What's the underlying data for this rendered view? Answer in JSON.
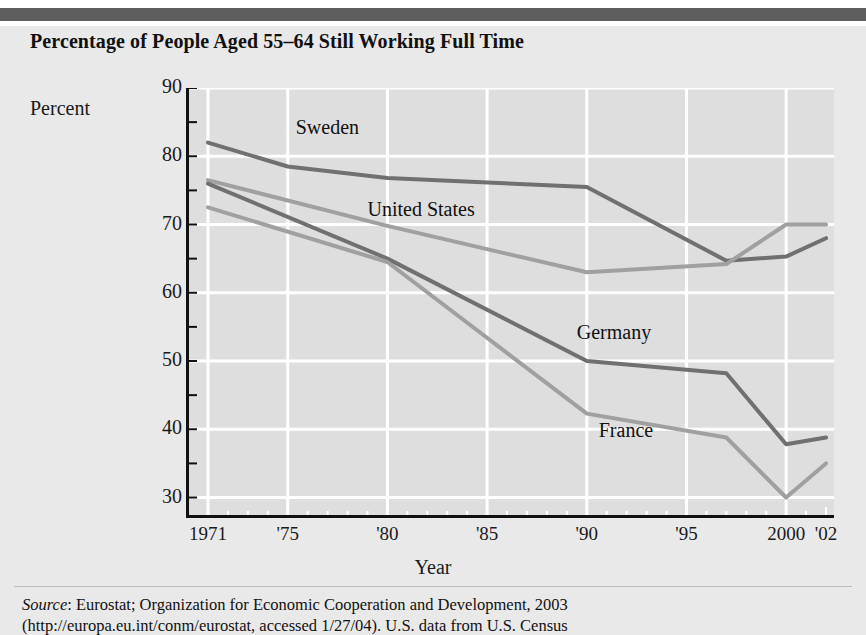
{
  "figure": {
    "title": "Percentage of People Aged 55–64 Still Working Full Time",
    "ylabel_text": "Percent",
    "xlabel_text": "Year",
    "source_prefix": "Source",
    "source_line1": ": Eurostat; Organization for Economic Cooperation and Development, 2003",
    "source_line2": "(http://europa.eu.int/conm/eurostat, accessed 1/27/04). U.S. data from U.S. Census"
  },
  "colors": {
    "page_background": "#ffffff",
    "panel_background": "#e9e9e9",
    "topbar": "#5e5e5e",
    "plot_background": "#dedede",
    "gridline": "#ffffff",
    "axis": "#111111",
    "series_dark": "#707070",
    "series_light": "#a0a0a0",
    "text": "#111111"
  },
  "chart_data": {
    "type": "line",
    "title": "Percentage of People Aged 55–64 Still Working Full Time",
    "xlabel": "Year",
    "ylabel": "Percent",
    "xlim": [
      1971,
      2002
    ],
    "ylim": [
      27,
      90
    ],
    "grid": true,
    "legend": "inline-labels",
    "yticks": [
      90,
      80,
      70,
      60,
      50,
      40,
      30
    ],
    "xticks": [
      {
        "value": 1971,
        "label": "1971"
      },
      {
        "value": 1975,
        "label": "'75"
      },
      {
        "value": 1980,
        "label": "'80"
      },
      {
        "value": 1985,
        "label": "'85"
      },
      {
        "value": 1990,
        "label": "'90"
      },
      {
        "value": 1995,
        "label": "'95"
      },
      {
        "value": 2000,
        "label": "2000"
      },
      {
        "value": 2002,
        "label": "'02"
      }
    ],
    "series": [
      {
        "name": "Sweden",
        "color": "#707070",
        "label_x": 1975.4,
        "label_y": 84.0,
        "x": [
          1971,
          1975,
          1980,
          1990,
          1997,
          2000,
          2002
        ],
        "values": [
          82.0,
          78.5,
          76.8,
          75.5,
          64.7,
          65.3,
          68.0
        ]
      },
      {
        "name": "United States",
        "color": "#a0a0a0",
        "label_x": 1979.0,
        "label_y": 72.0,
        "x": [
          1971,
          1980,
          1990,
          1997,
          2000,
          2002
        ],
        "values": [
          76.5,
          69.8,
          63.0,
          64.2,
          70.0,
          70.0
        ]
      },
      {
        "name": "Germany",
        "color": "#707070",
        "label_x": 1989.5,
        "label_y": 54.0,
        "x": [
          1971,
          1980,
          1990,
          1997,
          2000,
          2002
        ],
        "values": [
          76.0,
          65.0,
          50.0,
          48.2,
          37.8,
          38.8
        ]
      },
      {
        "name": "France",
        "color": "#a0a0a0",
        "label_x": 1990.6,
        "label_y": 39.6,
        "x": [
          1971,
          1980,
          1990,
          1997,
          2000,
          2002
        ],
        "values": [
          72.5,
          64.5,
          42.3,
          38.8,
          30.0,
          35.0
        ]
      }
    ]
  }
}
